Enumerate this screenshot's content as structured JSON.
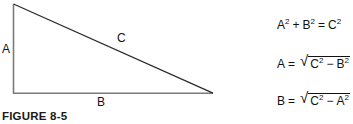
{
  "figure": {
    "caption": "FIGURE 8-5",
    "background_color": "#ffffff",
    "ink_color": "#111111",
    "diagram": {
      "type": "right-triangle",
      "description": "Right triangle with vertical leg A, horizontal leg B, and hypotenuse C",
      "stroke_color_legs": "#7a7a7a",
      "stroke_color_hypotenuse": "#2b2b2b",
      "vertices": {
        "top_left": [
          13,
          4
        ],
        "bottom_left": [
          13,
          93
        ],
        "bottom_right": [
          213,
          93
        ]
      },
      "labels": [
        {
          "id": "A",
          "text": "A",
          "side": "vertical-leg"
        },
        {
          "id": "B",
          "text": "B",
          "side": "horizontal-leg"
        },
        {
          "id": "C",
          "text": "C",
          "side": "hypotenuse"
        }
      ]
    },
    "equations": [
      {
        "id": "pythagorean-theorem",
        "lhs": "A",
        "lhs_exp": "2",
        "op1": "+",
        "mid": "B",
        "mid_exp": "2",
        "eq": "=",
        "rhs": "C",
        "rhs_exp": "2",
        "plain": "A² + B² = C²",
        "has_radical": false
      },
      {
        "id": "solve-for-a",
        "lhs": "A",
        "eq": "=",
        "radicand_first": "C",
        "radicand_first_exp": "2",
        "radicand_op": "−",
        "radicand_second": "B",
        "radicand_second_exp": "2",
        "plain": "A = √(C² − B²)",
        "has_radical": true
      },
      {
        "id": "solve-for-b",
        "lhs": "B",
        "eq": "=",
        "radicand_first": "C",
        "radicand_first_exp": "2",
        "radicand_op": "−",
        "radicand_second": "A",
        "radicand_second_exp": "2",
        "plain": "B = √(C² − A²)",
        "has_radical": true
      }
    ],
    "radical_glyph": "√"
  }
}
